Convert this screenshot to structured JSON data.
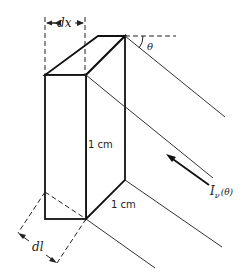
{
  "diagram": {
    "type": "geometry-figure",
    "labels": {
      "dx": "dx",
      "theta": "θ",
      "height": "1 cm",
      "depth": "1 cm",
      "dl": "dl",
      "intensity": "I",
      "intensity_sub": "ν",
      "intensity_arg": "(θ)"
    },
    "colors": {
      "line": "#222222",
      "background": "#ffffff"
    }
  }
}
